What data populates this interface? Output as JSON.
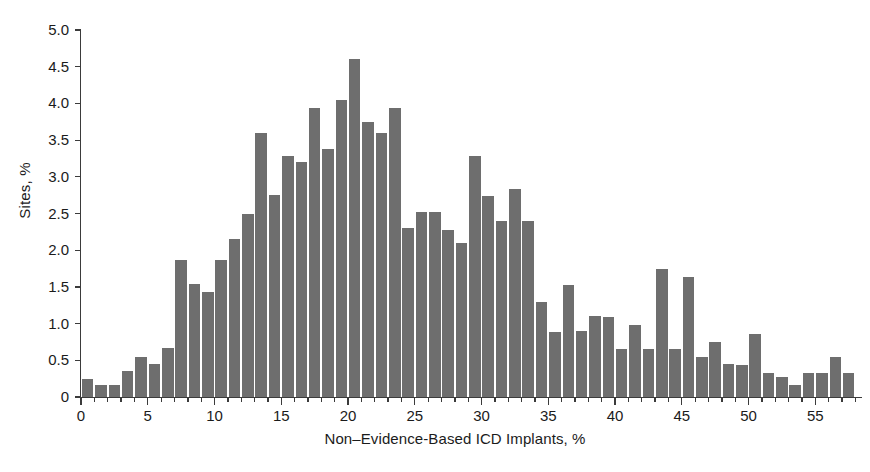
{
  "chart_data": {
    "type": "bar",
    "title": "",
    "subtitle": "",
    "xlabel": "Non–Evidence-Based ICD Implants, %",
    "ylabel": "Sites, %",
    "xlim": [
      0,
      58.5
    ],
    "ylim": [
      0,
      5.0
    ],
    "grid": false,
    "legend": null,
    "bar_color": "#6e6e6e",
    "axis_color": "#3b3b3b",
    "background": "#ffffff",
    "bar_width": 1,
    "bin_width": 1,
    "x_major_ticks": [
      0,
      5,
      10,
      15,
      20,
      25,
      30,
      35,
      40,
      45,
      50,
      55
    ],
    "x_major_tick_labels": [
      "0",
      "5",
      "10",
      "15",
      "20",
      "25",
      "30",
      "35",
      "40",
      "45",
      "50",
      "55"
    ],
    "x_minor_tick_step": 1,
    "y_ticks": [
      0,
      0.5,
      1.0,
      1.5,
      2.0,
      2.5,
      3.0,
      3.5,
      4.0,
      4.5,
      5.0
    ],
    "y_tick_labels": [
      "0",
      "0.5",
      "1.0",
      "1.5",
      "2.0",
      "2.5",
      "3.0",
      "3.5",
      "4.0",
      "4.5",
      "5.0"
    ],
    "x": [
      0.5,
      1.5,
      2.5,
      3.5,
      4.5,
      5.5,
      6.5,
      7.5,
      8.5,
      9.5,
      10.5,
      11.5,
      12.5,
      13.5,
      14.5,
      15.5,
      16.5,
      17.5,
      18.5,
      19.5,
      20.5,
      21.5,
      22.5,
      23.5,
      24.5,
      25.5,
      26.5,
      27.5,
      28.5,
      29.5,
      30.5,
      31.5,
      32.5,
      33.5,
      34.5,
      35.5,
      36.5,
      37.5,
      38.5,
      39.5,
      40.5,
      41.5,
      42.5,
      43.5,
      44.5,
      45.5,
      46.5,
      47.5,
      48.5,
      49.5,
      50.5,
      51.5,
      52.5,
      53.5,
      54.5,
      55.5,
      56.5,
      57.5
    ],
    "categories": [
      "0-1",
      "1-2",
      "2-3",
      "3-4",
      "4-5",
      "5-6",
      "6-7",
      "7-8",
      "8-9",
      "9-10",
      "10-11",
      "11-12",
      "12-13",
      "13-14",
      "14-15",
      "15-16",
      "16-17",
      "17-18",
      "18-19",
      "19-20",
      "20-21",
      "21-22",
      "22-23",
      "23-24",
      "24-25",
      "25-26",
      "26-27",
      "27-28",
      "28-29",
      "29-30",
      "30-31",
      "31-32",
      "32-33",
      "33-34",
      "34-35",
      "35-36",
      "36-37",
      "37-38",
      "38-39",
      "39-40",
      "40-41",
      "41-42",
      "42-43",
      "43-44",
      "44-45",
      "45-46",
      "46-47",
      "47-48",
      "48-49",
      "49-50",
      "50-51",
      "51-52",
      "52-53",
      "53-54",
      "54-55",
      "55-56",
      "56-57",
      "57-58"
    ],
    "values": [
      0.25,
      0.16,
      0.16,
      0.35,
      0.55,
      0.45,
      0.67,
      1.86,
      1.54,
      1.43,
      1.87,
      2.15,
      2.5,
      3.6,
      2.75,
      3.28,
      3.2,
      3.94,
      3.38,
      4.05,
      4.6,
      3.74,
      3.6,
      3.94,
      2.3,
      2.52,
      2.52,
      2.28,
      2.1,
      3.28,
      2.74,
      2.4,
      2.84,
      2.4,
      1.3,
      0.88,
      1.53,
      0.9,
      1.1,
      1.09,
      0.66,
      0.98,
      0.66,
      1.75,
      0.66,
      1.64,
      0.55,
      0.75,
      0.45,
      0.43,
      0.86,
      0.33,
      0.27,
      0.16,
      0.33,
      0.33,
      0.55,
      0.33
    ],
    "peak": {
      "bin": "20-21",
      "value": 4.6
    },
    "n_bins": 58
  }
}
